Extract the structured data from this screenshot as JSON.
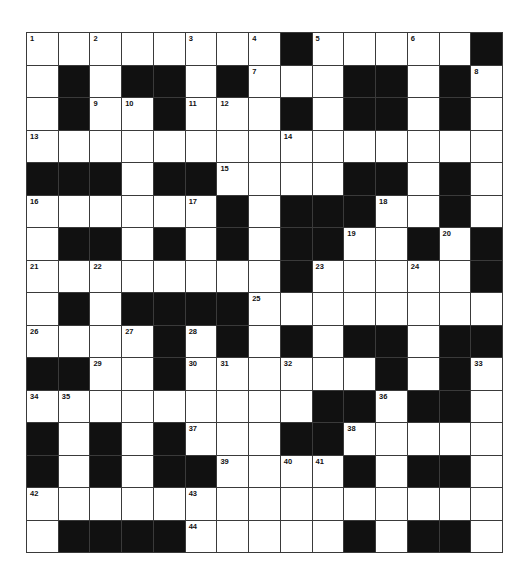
{
  "puzzle": {
    "cols": 15,
    "rows": 16,
    "colors": {
      "block": "#111111",
      "cell": "#ffffff",
      "gridline": "#3a3a3a"
    },
    "layout": [
      "........#.....#",
      ".#.##.#...##.#.",
      ".#..#...#.##.#.",
      "...............",
      "###.##....##.#.",
      "......#.###..#.",
      ".##.#.#.##..#.#",
      "........#.....#",
      ".#.####........",
      "....#.#.#.##.##",
      "##..#......#.#.",
      ".........##.##.",
      "#.#.#...##.....",
      "#.#.##....#.##.",
      "...............",
      ".####.....#.##."
    ],
    "numbers": [
      {
        "n": "1",
        "r": 0,
        "c": 0
      },
      {
        "n": "2",
        "r": 0,
        "c": 2
      },
      {
        "n": "3",
        "r": 0,
        "c": 5
      },
      {
        "n": "4",
        "r": 0,
        "c": 7
      },
      {
        "n": "5",
        "r": 0,
        "c": 9
      },
      {
        "n": "6",
        "r": 0,
        "c": 12
      },
      {
        "n": "7",
        "r": 1,
        "c": 7
      },
      {
        "n": "8",
        "r": 1,
        "c": 14
      },
      {
        "n": "9",
        "r": 2,
        "c": 2
      },
      {
        "n": "10",
        "r": 2,
        "c": 3
      },
      {
        "n": "11",
        "r": 2,
        "c": 5
      },
      {
        "n": "12",
        "r": 2,
        "c": 6
      },
      {
        "n": "13",
        "r": 3,
        "c": 0
      },
      {
        "n": "14",
        "r": 3,
        "c": 8
      },
      {
        "n": "15",
        "r": 4,
        "c": 6
      },
      {
        "n": "16",
        "r": 5,
        "c": 0
      },
      {
        "n": "17",
        "r": 5,
        "c": 5
      },
      {
        "n": "18",
        "r": 5,
        "c": 11
      },
      {
        "n": "19",
        "r": 6,
        "c": 10
      },
      {
        "n": "20",
        "r": 6,
        "c": 13
      },
      {
        "n": "21",
        "r": 7,
        "c": 0
      },
      {
        "n": "22",
        "r": 7,
        "c": 2
      },
      {
        "n": "23",
        "r": 7,
        "c": 9
      },
      {
        "n": "24",
        "r": 7,
        "c": 12
      },
      {
        "n": "25",
        "r": 8,
        "c": 7
      },
      {
        "n": "26",
        "r": 9,
        "c": 0
      },
      {
        "n": "27",
        "r": 9,
        "c": 3
      },
      {
        "n": "28",
        "r": 9,
        "c": 5
      },
      {
        "n": "29",
        "r": 10,
        "c": 2
      },
      {
        "n": "30",
        "r": 10,
        "c": 5
      },
      {
        "n": "31",
        "r": 10,
        "c": 6
      },
      {
        "n": "32",
        "r": 10,
        "c": 8
      },
      {
        "n": "33",
        "r": 10,
        "c": 14
      },
      {
        "n": "34",
        "r": 11,
        "c": 0
      },
      {
        "n": "35",
        "r": 11,
        "c": 1
      },
      {
        "n": "36",
        "r": 11,
        "c": 11
      },
      {
        "n": "37",
        "r": 12,
        "c": 5
      },
      {
        "n": "38",
        "r": 12,
        "c": 10
      },
      {
        "n": "39",
        "r": 13,
        "c": 6
      },
      {
        "n": "40",
        "r": 13,
        "c": 8
      },
      {
        "n": "41",
        "r": 13,
        "c": 9
      },
      {
        "n": "42",
        "r": 14,
        "c": 0
      },
      {
        "n": "43",
        "r": 14,
        "c": 5
      },
      {
        "n": "44",
        "r": 15,
        "c": 5
      }
    ]
  }
}
